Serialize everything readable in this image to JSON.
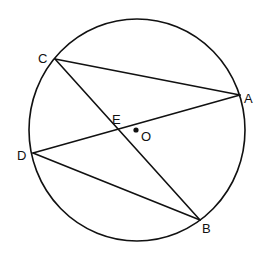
{
  "diagram": {
    "type": "geometry-circle-chords",
    "circle": {
      "center_label": "O",
      "cx": 137,
      "cy": 130,
      "rx": 108,
      "ry": 111
    },
    "points": {
      "A": {
        "label": "A",
        "x": 240,
        "y": 95,
        "lx": 244,
        "ly": 103
      },
      "B": {
        "label": "B",
        "x": 200,
        "y": 220,
        "lx": 202,
        "ly": 233
      },
      "C": {
        "label": "C",
        "x": 55,
        "y": 59,
        "lx": 38,
        "ly": 63
      },
      "D": {
        "label": "D",
        "x": 33,
        "y": 153,
        "lx": 17,
        "ly": 160
      },
      "E": {
        "label": "E",
        "x": 117,
        "y": 130,
        "lx": 112,
        "ly": 124
      },
      "O": {
        "label": "O",
        "x": 136,
        "y": 130,
        "lx": 141,
        "ly": 141
      }
    },
    "segments": [
      "CA",
      "CB",
      "DA",
      "DB"
    ],
    "stroke_color": "#111111",
    "background": "#ffffff"
  }
}
